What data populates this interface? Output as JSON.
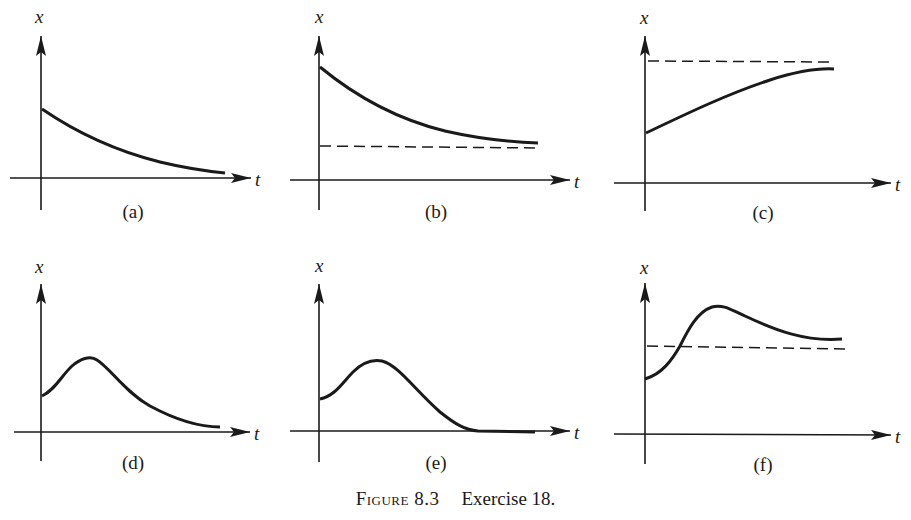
{
  "figure": {
    "caption_label": "Figure 8.3",
    "caption_text": "Exercise 18.",
    "axis_vertical_label": "x",
    "axis_horizontal_label": "t",
    "ink_color": "#1a1a1a",
    "background_color": "#ffffff"
  },
  "panels": [
    {
      "id": "a",
      "label": "(a)",
      "description": "Monotonically decaying curve approaching zero",
      "has_dashed_asymptote": false
    },
    {
      "id": "b",
      "label": "(b)",
      "description": "Decaying curve approaching a positive dashed asymptote from above",
      "has_dashed_asymptote": true
    },
    {
      "id": "c",
      "label": "(c)",
      "description": "Increasing curve approaching a dashed asymptote from below",
      "has_dashed_asymptote": true
    },
    {
      "id": "d",
      "label": "(d)",
      "description": "Curve rises to a peak then decays toward zero",
      "has_dashed_asymptote": false
    },
    {
      "id": "e",
      "label": "(e)",
      "description": "Curve rises to a peak then decays to zero and stays flat on the t-axis",
      "has_dashed_asymptote": false
    },
    {
      "id": "f",
      "label": "(f)",
      "description": "Curve rises, overshoots a dashed asymptote, peaks, then settles toward it from above",
      "has_dashed_asymptote": true
    }
  ]
}
